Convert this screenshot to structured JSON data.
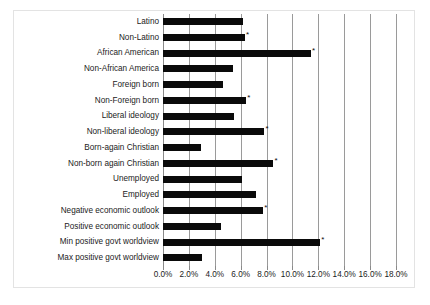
{
  "chart_data": {
    "type": "bar",
    "orientation": "horizontal",
    "title": "",
    "subtitle": "",
    "xlabel": "",
    "ylabel": "",
    "xlim": [
      0.0,
      18.0
    ],
    "grid": true,
    "legend": null,
    "tick_suffix": "%",
    "xticks": [
      0.0,
      2.0,
      4.0,
      6.0,
      8.0,
      10.0,
      12.0,
      14.0,
      16.0,
      18.0
    ],
    "xtick_labels": [
      "0.0%",
      "2.0%",
      "4.0%",
      "6.0%",
      "8.0%",
      "10.0%",
      "12.0%",
      "14.0%",
      "16.0%",
      "18.0%"
    ],
    "significance_marker": "*",
    "categories": [
      "Latino",
      "Non-Latino",
      "African American",
      "Non-African America",
      "Foreign born",
      "Non-Foreign born",
      "Liberal ideology",
      "Non-liberal ideology",
      "Born-again Christian",
      "Non-born again Christian",
      "Unemployed",
      "Employed",
      "Negative economic outlook",
      "Positive economic outlook",
      "Min positive govt worldview",
      "Max positive govt worldview"
    ],
    "values": [
      6.2,
      6.3,
      11.4,
      5.4,
      4.6,
      6.4,
      5.5,
      7.8,
      2.9,
      8.5,
      6.1,
      7.2,
      7.7,
      4.5,
      12.1,
      3.0
    ],
    "significant": [
      false,
      true,
      true,
      false,
      false,
      true,
      false,
      true,
      false,
      true,
      false,
      false,
      true,
      false,
      true,
      false
    ],
    "bar_color": "#0a0a0a"
  },
  "colors": {
    "bar": "#0a0a0a",
    "gridline": "#9a9a9a",
    "frame": "#e3e3e3",
    "text": "#1b1b1b",
    "background": "#ffffff"
  }
}
